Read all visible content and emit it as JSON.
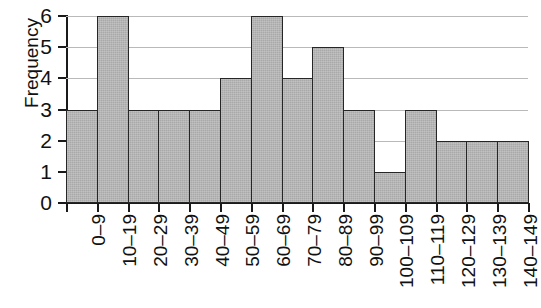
{
  "chart_data": {
    "type": "bar",
    "title": "",
    "subtitle": "",
    "xlabel": "",
    "ylabel": "Frequency",
    "categories": [
      "0–9",
      "10–19",
      "20–29",
      "30–39",
      "40–49",
      "50–59",
      "60–69",
      "70–79",
      "80–89",
      "90–99",
      "100–109",
      "110–119",
      "120–129",
      "130–139",
      "140–149"
    ],
    "values": [
      3,
      6,
      3,
      3,
      3,
      4,
      6,
      4,
      5,
      3,
      1,
      3,
      2,
      2,
      2
    ],
    "ylim": [
      0,
      6
    ],
    "yticks": [
      0,
      1,
      2,
      3,
      4,
      5,
      6
    ],
    "ytick_labels": [
      "0",
      "1",
      "2",
      "3",
      "4",
      "5",
      "6"
    ],
    "grid": true,
    "grid_axis": "y",
    "legend": false,
    "legend_position": "none",
    "bar_fill_color": "#a9a9a9",
    "bar_edge_color": "#262626",
    "gridline_color": "#b9b9b9",
    "axis_color": "#1a1a1a",
    "text_color": "#111111",
    "background_color": "#ffffff",
    "bar_gap": 0,
    "xtick_label_rotation": 90
  }
}
